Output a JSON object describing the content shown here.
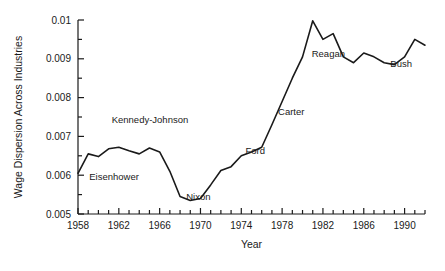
{
  "chart_data": {
    "type": "line",
    "title": "",
    "xlabel": "Year",
    "ylabel": "Wage Dispersion Across Industries",
    "xlim": [
      1958,
      1992
    ],
    "ylim": [
      0.005,
      0.01
    ],
    "grid": false,
    "legend": "none",
    "line_color": "#1a1a1a",
    "background_color": "#ffffff",
    "x_tick_labels": [
      "1958",
      "1962",
      "1966",
      "1970",
      "1974",
      "1978",
      "1982",
      "1986",
      "1990"
    ],
    "x_tick_values": [
      1958,
      1962,
      1966,
      1970,
      1974,
      1978,
      1982,
      1986,
      1990
    ],
    "x_minor_step": 1,
    "y_tick_labels": [
      "0.005",
      "0.006",
      "0.007",
      "0.008",
      "0.009",
      "0.01"
    ],
    "y_tick_values": [
      0.005,
      0.006,
      0.007,
      0.008,
      0.009,
      0.01
    ],
    "y_minor_step": 0.0005,
    "x": [
      1958,
      1959,
      1960,
      1961,
      1962,
      1963,
      1964,
      1965,
      1966,
      1967,
      1968,
      1969,
      1970,
      1971,
      1972,
      1973,
      1974,
      1975,
      1976,
      1977,
      1978,
      1979,
      1980,
      1981,
      1982,
      1983,
      1984,
      1985,
      1986,
      1987,
      1988,
      1989,
      1990,
      1991,
      1992
    ],
    "values": [
      0.00605,
      0.00655,
      0.00648,
      0.00668,
      0.00672,
      0.00663,
      0.00655,
      0.0067,
      0.0066,
      0.0061,
      0.00545,
      0.00535,
      0.0054,
      0.00575,
      0.00612,
      0.00622,
      0.0065,
      0.0066,
      0.00672,
      0.0073,
      0.0079,
      0.0085,
      0.00905,
      0.00998,
      0.0095,
      0.00965,
      0.00905,
      0.0089,
      0.00915,
      0.00905,
      0.0089,
      0.00885,
      0.00905,
      0.0095,
      0.00935
    ],
    "annotations": [
      {
        "label": "Eisenhower",
        "x": 1959.1,
        "y": 0.00588
      },
      {
        "label": "Kennedy-Johnson",
        "x": 1961.3,
        "y": 0.00735
      },
      {
        "label": "Nixon",
        "x": 1968.6,
        "y": 0.00535
      },
      {
        "label": "Ford",
        "x": 1974.4,
        "y": 0.00655
      },
      {
        "label": "Carter",
        "x": 1977.6,
        "y": 0.00755
      },
      {
        "label": "Reagan",
        "x": 1980.9,
        "y": 0.00905
      },
      {
        "label": "Bush",
        "x": 1988.6,
        "y": 0.00878
      }
    ]
  }
}
